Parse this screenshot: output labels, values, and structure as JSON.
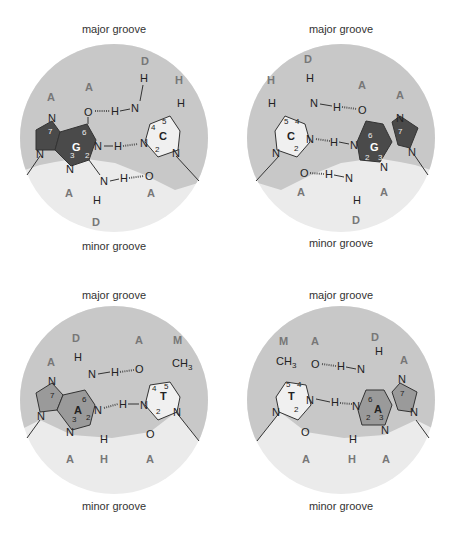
{
  "labels": {
    "major_groove": "major groove",
    "minor_groove": "minor groove"
  },
  "colors": {
    "major_groove_bg": "#c8c8c8",
    "minor_groove_bg": "#ebebeb",
    "guanine_fill": "#4a4a4a",
    "adenine_fill": "#9a9a9a",
    "pyrimidine_fill": "#f0f0f0",
    "code_letter": "#777777"
  },
  "panels": [
    {
      "id": "GC",
      "left_base": "G",
      "right_base": "C",
      "major_codes": [
        "A",
        "A",
        "D",
        "H"
      ],
      "minor_codes": [
        "A",
        "D",
        "A"
      ],
      "c_nums": [
        "4",
        "5",
        "2"
      ],
      "g_nums": [
        "7",
        "6",
        "3",
        "2"
      ]
    },
    {
      "id": "CG",
      "left_base": "C",
      "right_base": "G",
      "major_codes": [
        "H",
        "D",
        "A",
        "A"
      ],
      "minor_codes": [
        "A",
        "D",
        "A"
      ],
      "c_nums": [
        "5",
        "4",
        "2"
      ],
      "g_nums": [
        "6",
        "7",
        "2",
        "3"
      ]
    },
    {
      "id": "AT",
      "left_base": "A",
      "right_base": "T",
      "major_codes": [
        "A",
        "D",
        "A",
        "M"
      ],
      "minor_codes": [
        "A",
        "H",
        "A"
      ],
      "t_nums": [
        "4",
        "5",
        "2"
      ],
      "a_nums": [
        "7",
        "6",
        "3",
        "2"
      ]
    },
    {
      "id": "TA",
      "left_base": "T",
      "right_base": "A",
      "major_codes": [
        "M",
        "A",
        "D",
        "A"
      ],
      "minor_codes": [
        "A",
        "H",
        "A"
      ],
      "t_nums": [
        "5",
        "4",
        "2"
      ],
      "a_nums": [
        "6",
        "7",
        "2",
        "3"
      ]
    }
  ],
  "atoms": {
    "N": "N",
    "O": "O",
    "H": "H",
    "CH3": "CH",
    "sub3": "3"
  }
}
